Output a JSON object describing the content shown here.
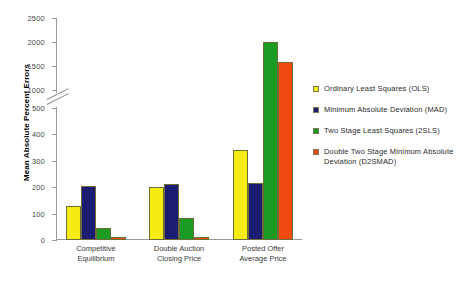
{
  "chart_data": {
    "type": "bar",
    "title": "",
    "xlabel": "",
    "ylabel": "Mean Absolute Percent Errors",
    "categories": [
      "Competitive Equilibrium",
      "Double Auction Closing Price",
      "Posted Offer Average Price"
    ],
    "category_lines": [
      [
        "Competitive",
        "Equilibrium"
      ],
      [
        "Double Auction",
        "Closing Price"
      ],
      [
        "Posted Offer",
        "Average Price"
      ]
    ],
    "series": [
      {
        "name": "Ordinary Least Squares (OLS)",
        "short": "OLS",
        "color": "#f5ec13",
        "values": [
          130,
          200,
          340
        ]
      },
      {
        "name": "Minimum Absolute Deviation (MAD)",
        "short": "MAD",
        "color": "#1c1c70",
        "values": [
          205,
          212,
          215
        ]
      },
      {
        "name": "Two Stage Least Squares (2SLS)",
        "short": "2SLS",
        "color": "#1a9b24",
        "values": [
          45,
          85,
          2000
        ]
      },
      {
        "name": "Double Two Stage Minimum Absolute Deviation (D2SMAD)",
        "short": "D2SMAD",
        "color": "#f04a10",
        "values": [
          12,
          13,
          1580
        ]
      }
    ],
    "yticks": [
      0,
      100,
      200,
      300,
      400,
      500,
      1000,
      1500,
      2000,
      2500
    ],
    "ytick_labels": [
      "0",
      "100",
      "200",
      "300",
      "400",
      "500",
      "1000",
      "1500",
      "2000",
      "2500"
    ],
    "ylim": [
      0,
      2500
    ],
    "axis_break": {
      "present": true,
      "lower": 500,
      "upper": 1000
    },
    "grid": false,
    "legend_position": "right"
  },
  "legend": {
    "items": [
      {
        "label": "Ordinary Least Squares (OLS)",
        "swatch": "#f5ec13"
      },
      {
        "label": "Minimum Absolute Deviation (MAD)",
        "swatch": "#1c1c70"
      },
      {
        "label": "Two Stage Least Squares (2SLS)",
        "swatch": "#1a9b24"
      },
      {
        "label": "Double Two Stage Minimum Absolute Deviation (D2SMAD)",
        "swatch": "#f04a10"
      }
    ]
  }
}
